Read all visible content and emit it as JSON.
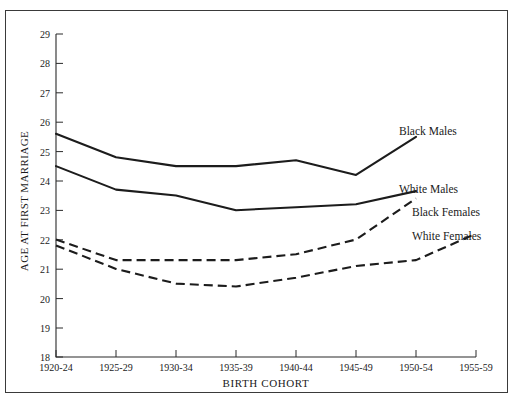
{
  "figure": {
    "background_color": "#ffffff",
    "border_color": "#3a3a3a",
    "line_color": "#1c1c1c"
  },
  "chart_data": {
    "type": "line",
    "title": "",
    "xlabel": "BIRTH  COHORT",
    "ylabel": "AGE AT FIRST MARRIAGE",
    "categories": [
      "1920-24",
      "1925-29",
      "1930-34",
      "1935-39",
      "1940-44",
      "1945-49",
      "1950-54",
      "1955-59"
    ],
    "ylim": [
      18,
      29
    ],
    "yticks": [
      18,
      19,
      20,
      21,
      22,
      23,
      24,
      25,
      26,
      27,
      28,
      29
    ],
    "grid": false,
    "legend_position": "inline-right-labels",
    "series": [
      {
        "name": "Black Males",
        "style": "solid",
        "label_anchor": "1950-54",
        "values": [
          25.6,
          24.8,
          24.5,
          24.5,
          24.7,
          24.2,
          25.5,
          null
        ]
      },
      {
        "name": "White Males",
        "style": "solid",
        "label_anchor": "1950-54",
        "values": [
          24.5,
          23.7,
          23.5,
          23.0,
          23.1,
          23.2,
          23.65,
          null
        ]
      },
      {
        "name": "Black Females",
        "style": "dashed",
        "label_anchor": "1950-54",
        "values": [
          22.0,
          21.3,
          21.3,
          21.3,
          21.5,
          22.0,
          23.4,
          null
        ]
      },
      {
        "name": "White Females",
        "style": "dashed",
        "label_anchor": "1955-59",
        "values": [
          21.8,
          21.0,
          20.5,
          20.4,
          20.7,
          21.1,
          21.3,
          22.2
        ]
      }
    ]
  }
}
